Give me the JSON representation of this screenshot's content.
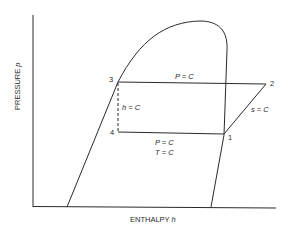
{
  "diagram": {
    "axes": {
      "y_label": "PRESSURE",
      "y_symbol": "p",
      "x_label": "ENTHALPY",
      "x_symbol": "h"
    },
    "points": [
      {
        "id": "1",
        "label": "1"
      },
      {
        "id": "2",
        "label": "2"
      },
      {
        "id": "3",
        "label": "3"
      },
      {
        "id": "4",
        "label": "4"
      }
    ],
    "process_labels": {
      "high_pressure": "P = C",
      "expansion": "h = C",
      "compression": "s = C",
      "evaporation_p": "P = C",
      "evaporation_t": "T = C"
    },
    "colors": {
      "line": "#2a2a2a",
      "background": "#ffffff"
    }
  }
}
